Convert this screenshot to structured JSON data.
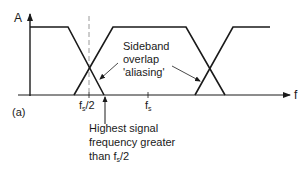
{
  "diagram": {
    "y_axis_label": "A",
    "x_axis_label": "f",
    "panel_label": "(a)",
    "tick_labels": {
      "half_fs": {
        "main": "f",
        "sub": "s",
        "tail": "/2"
      },
      "fs": {
        "main": "f",
        "sub": "s",
        "tail": ""
      }
    },
    "annotations": {
      "sideband": {
        "lines": [
          "Sideband",
          "overlap",
          "'aliasing'"
        ]
      },
      "highest_signal": {
        "line1": "Highest signal",
        "line2": "frequency greater",
        "line3_prefix": "than f",
        "line3_sub": "s",
        "line3_suffix": "/2"
      }
    },
    "colors": {
      "stroke": "#1a1a1a",
      "dashed": "#9a9a9a",
      "background": "#ffffff"
    }
  }
}
